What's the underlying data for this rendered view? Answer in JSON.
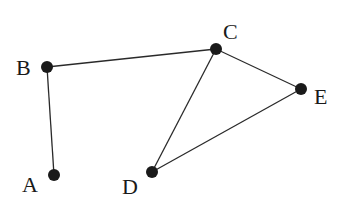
{
  "graph": {
    "nodes": [
      {
        "id": "A",
        "label": "A",
        "x": 54,
        "y": 175,
        "lx": 22,
        "ly": 192
      },
      {
        "id": "B",
        "label": "B",
        "x": 47,
        "y": 67,
        "lx": 16,
        "ly": 75
      },
      {
        "id": "C",
        "label": "C",
        "x": 216,
        "y": 49,
        "lx": 223,
        "ly": 39
      },
      {
        "id": "D",
        "label": "D",
        "x": 152,
        "y": 172,
        "lx": 122,
        "ly": 194
      },
      {
        "id": "E",
        "label": "E",
        "x": 301,
        "y": 89,
        "lx": 314,
        "ly": 104
      }
    ],
    "edges": [
      {
        "from": "A",
        "to": "B"
      },
      {
        "from": "B",
        "to": "C"
      },
      {
        "from": "C",
        "to": "E"
      },
      {
        "from": "C",
        "to": "D"
      },
      {
        "from": "D",
        "to": "E"
      }
    ],
    "colors": {
      "node": "#1a1a1a",
      "edge": "#2a2a2a",
      "background": "#ffffff"
    }
  }
}
